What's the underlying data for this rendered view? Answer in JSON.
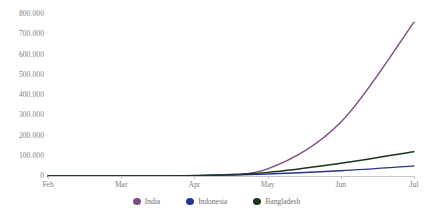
{
  "chart_data": {
    "type": "line",
    "title": "",
    "subtitle": "",
    "xlabel": "",
    "ylabel": "",
    "grid": false,
    "legend_position": "bottom",
    "x_tick_labels": [
      "Feb",
      "Mar",
      "Apr",
      "May",
      "Jun",
      "Jul"
    ],
    "y_tick_labels": [
      "800.000",
      "700.000",
      "600.000",
      "500.000",
      "400.000",
      "300.000",
      "200.000",
      "100.000",
      "0"
    ],
    "y_tick_values": [
      800000,
      700000,
      600000,
      500000,
      400000,
      300000,
      200000,
      100000,
      0
    ],
    "ylim": [
      0,
      800000
    ],
    "x": [
      "Feb",
      "Mar",
      "Apr",
      "May",
      "Jun",
      "Jul"
    ],
    "series": [
      {
        "name": "India",
        "color": "#7D4B82",
        "values": [
          0,
          0,
          1500,
          35000,
          265000,
          760000
        ]
      },
      {
        "name": "Indonesia",
        "color": "#24368F",
        "values": [
          0,
          0,
          2000,
          10000,
          26000,
          50000
        ]
      },
      {
        "name": "Bangladesh",
        "color": "#19361C",
        "values": [
          0,
          0,
          2500,
          18000,
          63000,
          120000
        ]
      }
    ]
  },
  "legend": {
    "items": [
      {
        "label": "India",
        "marker": "circle-marker-india"
      },
      {
        "label": "Indonesia",
        "marker": "circle-marker-indonesia"
      },
      {
        "label": "Bangladesh",
        "marker": "circle-marker-bangladesh"
      }
    ]
  },
  "axis": {
    "y_labels": [
      "800.000",
      "700.000",
      "600.000",
      "500.000",
      "400.000",
      "300.000",
      "200.000",
      "100.000",
      "0"
    ],
    "x_labels": [
      "Feb",
      "Mar",
      "Apr",
      "May",
      "Jun",
      "Jul"
    ]
  }
}
